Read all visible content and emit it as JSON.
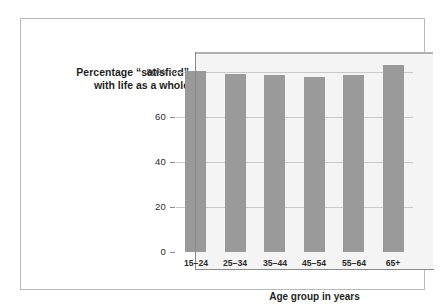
{
  "figure": {
    "background": "#ffffff",
    "frame_color": "#b9b9b9"
  },
  "chart_data": {
    "type": "bar",
    "title_line1": "Percentage “satisfied”",
    "title_line2": "with life as a whole",
    "xlabel": "Age group in years",
    "ylabel": "",
    "categories": [
      "15–24",
      "25–34",
      "35–44",
      "45–54",
      "55–64",
      "65+"
    ],
    "values": [
      80.5,
      79.0,
      78.8,
      78.0,
      78.8,
      83.0
    ],
    "ylim": [
      0,
      97
    ],
    "yticks": [
      0,
      20,
      40,
      60,
      80
    ],
    "ytick_labels": [
      "0",
      "20",
      "40",
      "60",
      "80%"
    ],
    "grid": true,
    "legend": "none",
    "bar_color": "#9a9a9a",
    "panel_color": "#f4f4f4",
    "gridline_color": "#c9c9c9",
    "axis_color": "#8a8a8a"
  }
}
